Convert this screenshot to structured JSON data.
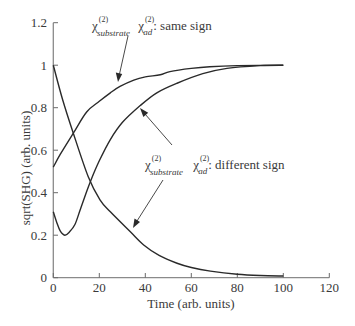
{
  "chart_data": {
    "type": "line",
    "title": "",
    "xlabel": "Time (arb. units)",
    "ylabel": "sqrt(SHG) (arb. units)",
    "xlim": [
      0,
      120
    ],
    "ylim": [
      0,
      1.2
    ],
    "xticks": [
      "0",
      "20",
      "40",
      "60",
      "80",
      "100",
      "120"
    ],
    "yticks": [
      "0",
      "0.2",
      "0.4",
      "0.6",
      "0.8",
      "1",
      "1.2"
    ],
    "grid": false,
    "legend": "none (curves labelled by arrow annotations)",
    "series": [
      {
        "name": "χ(2)substrate χ(2)ad: same sign",
        "points": [
          [
            0,
            0.52
          ],
          [
            3,
            0.58
          ],
          [
            8.7,
            0.68
          ],
          [
            14.5,
            0.78
          ],
          [
            20,
            0.83
          ],
          [
            24.8,
            0.87
          ],
          [
            29,
            0.9
          ],
          [
            35,
            0.93
          ],
          [
            40,
            0.945
          ],
          [
            46.5,
            0.955
          ],
          [
            50.7,
            0.97
          ],
          [
            60,
            0.985
          ],
          [
            68,
            0.993
          ],
          [
            80,
            0.998
          ],
          [
            100,
            1.0
          ]
        ]
      },
      {
        "name": "χ(2)substrate χ(2)ad: different sign",
        "points": [
          [
            0,
            0.31
          ],
          [
            1.5,
            0.26
          ],
          [
            3,
            0.22
          ],
          [
            5,
            0.2
          ],
          [
            7,
            0.215
          ],
          [
            9.4,
            0.25
          ],
          [
            11.7,
            0.32
          ],
          [
            14,
            0.39
          ],
          [
            16.4,
            0.46
          ],
          [
            20,
            0.55
          ],
          [
            24.8,
            0.65
          ],
          [
            30,
            0.73
          ],
          [
            37.8,
            0.81
          ],
          [
            45,
            0.87
          ],
          [
            53.8,
            0.915
          ],
          [
            65,
            0.96
          ],
          [
            75.5,
            0.985
          ],
          [
            90,
            0.998
          ],
          [
            100,
            1.0
          ]
        ]
      },
      {
        "name": "decaying curve (χ(2)substrate only)",
        "points": [
          [
            0,
            1.0
          ],
          [
            4,
            0.84
          ],
          [
            8.7,
            0.68
          ],
          [
            15.2,
            0.475
          ],
          [
            20.3,
            0.366
          ],
          [
            24.8,
            0.31
          ],
          [
            33.5,
            0.216
          ],
          [
            39.3,
            0.154
          ],
          [
            46,
            0.105
          ],
          [
            53.8,
            0.068
          ],
          [
            60,
            0.048
          ],
          [
            68.3,
            0.031
          ],
          [
            80,
            0.016
          ],
          [
            90,
            0.01
          ],
          [
            100,
            0.008
          ]
        ]
      }
    ],
    "annotations": [
      {
        "chi1": "χ",
        "sup1": "(2)",
        "sub1": "substrate",
        "chi2": "χ",
        "sup2": "(2)",
        "sub2": "ad",
        "text": ": same sign",
        "arrow_to_series": 0
      },
      {
        "chi1": "χ",
        "sup1": "(2)",
        "sub1": "substrate",
        "chi2": "χ",
        "sup2": "(2)",
        "sub2": "ad",
        "text": ": different sign",
        "arrow_to_series": [
          1,
          2
        ]
      }
    ]
  }
}
